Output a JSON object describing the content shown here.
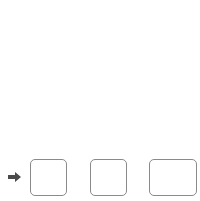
{
  "grid": {
    "outer": {
      "x": 21,
      "y": 13,
      "w": 164,
      "h": 133,
      "color": "#b5b5b5"
    },
    "dashed_v": [
      40,
      58,
      76,
      94,
      112,
      130,
      148,
      166
    ],
    "dashed_h": [
      32,
      51,
      70,
      89,
      108,
      127
    ],
    "dashed_color": "#c4c4c4",
    "bold_color": "#222222",
    "bold_top_y": 32,
    "bold_bottom_y": 136,
    "bold_x": [
      40,
      58,
      76,
      94,
      112,
      130,
      148,
      166
    ]
  },
  "equation": {
    "arrow_icon": "right-arrow-icon",
    "arrow_color": "#4a4a4a",
    "times_symbol": "×",
    "equals_symbol": "=",
    "boxes": [
      {
        "id": "factor-1",
        "value": ""
      },
      {
        "id": "factor-2",
        "value": ""
      },
      {
        "id": "product",
        "value": ""
      }
    ]
  }
}
